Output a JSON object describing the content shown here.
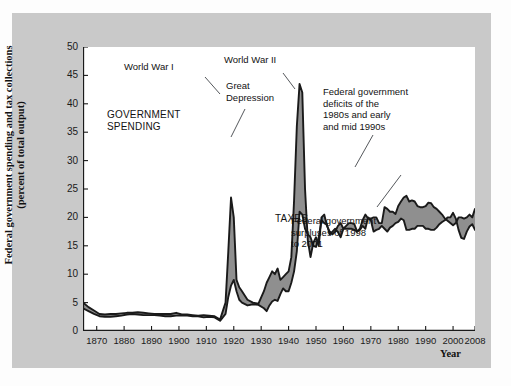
{
  "figure": {
    "background_color": "#c9c9c9",
    "plot_background_color": "#ffffff",
    "band_fill_color": "#8f8f8f",
    "line_color": "#1a1a1a"
  },
  "axis": {
    "y_title_line1": "Federal government spending and tax collections",
    "y_title_line2": "(percent of total output)",
    "x_title": "Year",
    "y_ticks": [
      "0",
      "5",
      "10",
      "15",
      "20",
      "25",
      "30",
      "35",
      "40",
      "45",
      "50"
    ],
    "x_ticks": [
      "1870",
      "1880",
      "1890",
      "1900",
      "1910",
      "1920",
      "1930",
      "1940",
      "1950",
      "1960",
      "1970",
      "1980",
      "1990",
      "2000",
      "2008"
    ]
  },
  "annotations": {
    "world_war_1": "World War I",
    "world_war_2": "World War II",
    "great_depression": "Great\nDepression",
    "government_spending": "GOVERNMENT\nSPENDING",
    "taxes": "TAXES",
    "deficits": "Federal government\ndeficits of the\n1980s and early\nand mid 1990s",
    "surpluses": "Federal government\nsurpluses of 1998\nto 2001"
  },
  "chart_data": {
    "type": "area",
    "title": "",
    "subtitle": "",
    "xlabel": "Year",
    "ylabel": "Federal government spending and tax collections (percent of total output)",
    "xlim": [
      1865,
      2008
    ],
    "ylim": [
      0,
      50
    ],
    "grid": false,
    "legend": "inline-labels",
    "x_tick_values": [
      1870,
      1880,
      1890,
      1900,
      1910,
      1920,
      1930,
      1940,
      1950,
      1960,
      1970,
      1980,
      1990,
      2000,
      2008
    ],
    "y_tick_values": [
      0,
      5,
      10,
      15,
      20,
      25,
      30,
      35,
      40,
      45,
      50
    ],
    "x": [
      1865,
      1867,
      1869,
      1871,
      1873,
      1875,
      1877,
      1879,
      1881,
      1883,
      1885,
      1887,
      1889,
      1891,
      1893,
      1895,
      1897,
      1899,
      1901,
      1903,
      1905,
      1907,
      1909,
      1911,
      1913,
      1915,
      1917,
      1918,
      1919,
      1920,
      1921,
      1922,
      1923,
      1925,
      1927,
      1929,
      1931,
      1932,
      1933,
      1934,
      1935,
      1936,
      1937,
      1938,
      1939,
      1940,
      1941,
      1942,
      1943,
      1944,
      1945,
      1946,
      1947,
      1948,
      1949,
      1950,
      1951,
      1952,
      1953,
      1954,
      1955,
      1956,
      1957,
      1958,
      1959,
      1960,
      1961,
      1962,
      1963,
      1964,
      1965,
      1966,
      1967,
      1968,
      1969,
      1970,
      1971,
      1972,
      1973,
      1974,
      1975,
      1976,
      1977,
      1978,
      1979,
      1980,
      1981,
      1982,
      1983,
      1984,
      1985,
      1986,
      1987,
      1988,
      1989,
      1990,
      1991,
      1992,
      1993,
      1994,
      1995,
      1996,
      1997,
      1998,
      1999,
      2000,
      2001,
      2002,
      2003,
      2004,
      2005,
      2006,
      2007,
      2008
    ],
    "series": [
      {
        "name": "GOVERNMENT SPENDING",
        "values": [
          5.0,
          4.2,
          3.6,
          3.0,
          2.9,
          3.0,
          3.0,
          3.1,
          3.2,
          3.2,
          3.3,
          3.2,
          3.1,
          3.0,
          3.0,
          3.0,
          3.0,
          3.2,
          2.9,
          2.9,
          2.8,
          2.7,
          2.8,
          2.7,
          2.6,
          2.0,
          5.0,
          14.0,
          23.5,
          20.0,
          9.0,
          7.7,
          7.0,
          5.5,
          5.0,
          4.8,
          7.0,
          8.5,
          9.5,
          10.5,
          10.0,
          11.0,
          9.0,
          9.5,
          10.0,
          10.5,
          13.0,
          23.0,
          36.0,
          43.5,
          42.0,
          25.0,
          16.0,
          13.0,
          15.5,
          16.5,
          15.0,
          20.0,
          20.5,
          18.5,
          17.5,
          17.0,
          17.5,
          18.5,
          19.0,
          18.0,
          18.5,
          19.0,
          19.0,
          18.8,
          17.5,
          18.0,
          19.5,
          20.5,
          19.8,
          19.8,
          20.0,
          20.0,
          19.0,
          19.0,
          21.8,
          21.5,
          21.0,
          21.0,
          20.6,
          22.0,
          22.8,
          23.5,
          23.8,
          22.8,
          23.0,
          22.8,
          22.0,
          21.8,
          21.8,
          22.0,
          22.6,
          22.5,
          21.8,
          21.5,
          21.0,
          20.5,
          19.8,
          19.4,
          19.0,
          18.6,
          19.0,
          20.0,
          20.0,
          19.8,
          20.0,
          20.5,
          20.0,
          21.5
        ]
      },
      {
        "name": "TAXES",
        "values": [
          4.0,
          3.5,
          3.0,
          2.6,
          2.5,
          2.5,
          2.6,
          2.7,
          2.9,
          3.0,
          2.9,
          2.8,
          2.8,
          2.8,
          2.7,
          2.6,
          2.6,
          2.7,
          2.7,
          2.7,
          2.6,
          2.6,
          2.4,
          2.5,
          2.4,
          1.8,
          3.0,
          6.0,
          8.0,
          9.0,
          7.0,
          5.5,
          5.0,
          4.5,
          4.7,
          4.6,
          4.0,
          3.5,
          4.5,
          5.2,
          5.5,
          5.3,
          6.5,
          7.5,
          7.0,
          7.0,
          8.5,
          10.5,
          14.0,
          21.0,
          20.5,
          18.0,
          17.0,
          16.5,
          15.0,
          14.8,
          16.5,
          19.5,
          19.0,
          18.7,
          17.0,
          17.5,
          18.0,
          17.4,
          16.5,
          18.0,
          18.0,
          18.0,
          18.0,
          17.8,
          17.5,
          17.8,
          18.5,
          18.0,
          20.0,
          19.5,
          17.5,
          17.8,
          18.0,
          18.5,
          18.0,
          17.5,
          18.2,
          18.5,
          19.0,
          19.2,
          19.8,
          19.5,
          17.8,
          17.8,
          18.0,
          18.0,
          18.5,
          18.5,
          18.5,
          18.0,
          18.0,
          17.8,
          17.8,
          18.2,
          18.8,
          19.2,
          19.5,
          20.0,
          20.0,
          20.8,
          19.8,
          17.8,
          16.4,
          16.2,
          17.5,
          18.4,
          18.8,
          17.8
        ]
      }
    ],
    "notes": [
      {
        "text": "World War I",
        "x": 1919,
        "y": 23.5
      },
      {
        "text": "World War II",
        "x": 1944,
        "y": 43.5
      },
      {
        "text": "Great Depression",
        "x": 1933,
        "y": 9.5
      },
      {
        "text": "Federal government deficits of the 1980s and early and mid 1990s",
        "x": 1986,
        "y": 23.0
      },
      {
        "text": "Federal government surpluses of 1998 to 2001",
        "x": 2000,
        "y": 20.0
      }
    ]
  }
}
